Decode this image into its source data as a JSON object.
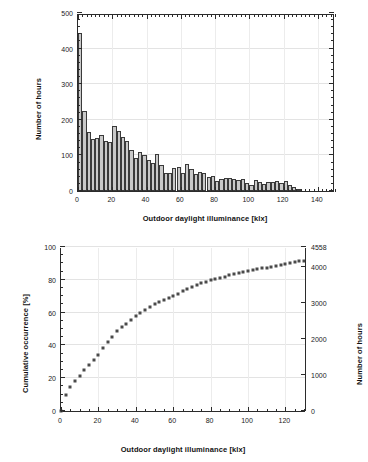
{
  "figure": {
    "width": 368,
    "height": 462,
    "background": "#ffffff",
    "bar_fill": "#c9c9c9",
    "bar_stroke": "#3a3a3a",
    "marker_color": "#4a4a4a",
    "axis_color": "#2b2b2b",
    "grid_color": "#e3e3e3"
  },
  "chart_data": [
    {
      "id": "histogram",
      "type": "bar",
      "title": "",
      "xlabel": "Outdoor daylight illuminance [klx]",
      "ylabel": "Number of hours",
      "xlim": [
        0,
        150
      ],
      "ylim": [
        0,
        500
      ],
      "xticks": [
        0,
        20,
        40,
        60,
        80,
        100,
        120,
        140
      ],
      "yticks": [
        0,
        100,
        200,
        300,
        400,
        500
      ],
      "xtick_labels": [
        "0",
        "20",
        "40",
        "60",
        "80",
        "100",
        "120",
        "140"
      ],
      "ytick_labels": [
        "0",
        "100",
        "200",
        "300",
        "400",
        "500"
      ],
      "grid": "horizontal",
      "bin_width": 2.5,
      "categories": [
        1.25,
        3.75,
        6.25,
        8.75,
        11.25,
        13.75,
        16.25,
        18.75,
        21.25,
        23.75,
        26.25,
        28.75,
        31.25,
        33.75,
        36.25,
        38.75,
        41.25,
        43.75,
        46.25,
        48.75,
        51.25,
        53.75,
        56.25,
        58.75,
        61.25,
        63.75,
        66.25,
        68.75,
        71.25,
        73.75,
        76.25,
        78.75,
        81.25,
        83.75,
        86.25,
        88.75,
        91.25,
        93.75,
        96.25,
        98.75,
        101.25,
        103.75,
        106.25,
        108.75,
        111.25,
        113.75,
        116.25,
        118.75,
        121.25,
        123.75,
        126.25,
        128.75
      ],
      "values": [
        445,
        225,
        167,
        146,
        150,
        156,
        140,
        139,
        182,
        168,
        152,
        140,
        115,
        94,
        110,
        101,
        86,
        79,
        105,
        74,
        52,
        50,
        65,
        67,
        51,
        76,
        62,
        47,
        53,
        52,
        40,
        42,
        29,
        33,
        36,
        37,
        35,
        32,
        34,
        22,
        18,
        30,
        25,
        19,
        24,
        26,
        28,
        22,
        29,
        16,
        11,
        2
      ]
    },
    {
      "id": "cumulative",
      "type": "scatter",
      "title": "",
      "xlabel": "Outdoor daylight illuminance [klx]",
      "ylabel": "Cumulative occurrence [%]",
      "ylabel_right": "Number of hours",
      "xlim": [
        0,
        131
      ],
      "ylim": [
        0,
        100
      ],
      "ylim_right": [
        0,
        4558
      ],
      "xticks": [
        0,
        20,
        40,
        60,
        80,
        100,
        120
      ],
      "yticks": [
        0,
        20,
        40,
        60,
        80,
        100
      ],
      "yticks_right": [
        0,
        1000,
        2000,
        3000,
        4000,
        4558
      ],
      "xtick_labels": [
        "0",
        "20",
        "40",
        "60",
        "80",
        "100",
        "120"
      ],
      "ytick_labels": [
        "0",
        "20",
        "40",
        "60",
        "80",
        "100"
      ],
      "ytick_right_labels": [
        "0",
        "1000",
        "2000",
        "3000",
        "4000",
        "4558"
      ],
      "total_hours": 4558,
      "grid": "horizontal",
      "x": [
        0.0,
        2.5,
        5.0,
        7.5,
        10.0,
        12.5,
        15.0,
        17.5,
        20.0,
        22.5,
        25.0,
        27.5,
        30.0,
        32.5,
        35.0,
        37.5,
        40.0,
        42.5,
        45.0,
        47.5,
        50.0,
        52.5,
        55.0,
        57.5,
        60.0,
        62.5,
        65.0,
        67.5,
        70.0,
        72.5,
        75.0,
        77.5,
        80.0,
        82.5,
        85.0,
        87.5,
        90.0,
        92.5,
        95.0,
        97.5,
        100.0,
        102.5,
        105.0,
        107.5,
        110.0,
        112.5,
        115.0,
        117.5,
        120.0,
        122.5,
        125.0,
        127.5,
        130.0
      ],
      "y": [
        0.0,
        9.8,
        14.7,
        18.4,
        21.6,
        24.9,
        28.3,
        31.4,
        34.4,
        38.4,
        42.1,
        45.4,
        48.5,
        51.0,
        53.1,
        55.5,
        57.7,
        59.6,
        61.4,
        63.7,
        65.3,
        66.4,
        67.5,
        69.0,
        70.4,
        71.5,
        73.2,
        74.6,
        75.6,
        76.7,
        77.9,
        78.8,
        79.7,
        80.3,
        81.1,
        81.9,
        82.7,
        83.5,
        84.3,
        85.0,
        85.5,
        85.9,
        86.5,
        87.1,
        87.5,
        88.0,
        88.6,
        89.2,
        89.8,
        90.4,
        91.0,
        91.3,
        91.5
      ]
    }
  ],
  "labels": {
    "x_axis_common": "Outdoor daylight illuminance [klx]",
    "y_axis_top": "Number of hours",
    "y_axis_bottom_left": "Cumulative occurrence [%]",
    "y_axis_bottom_right": "Number of hours"
  }
}
